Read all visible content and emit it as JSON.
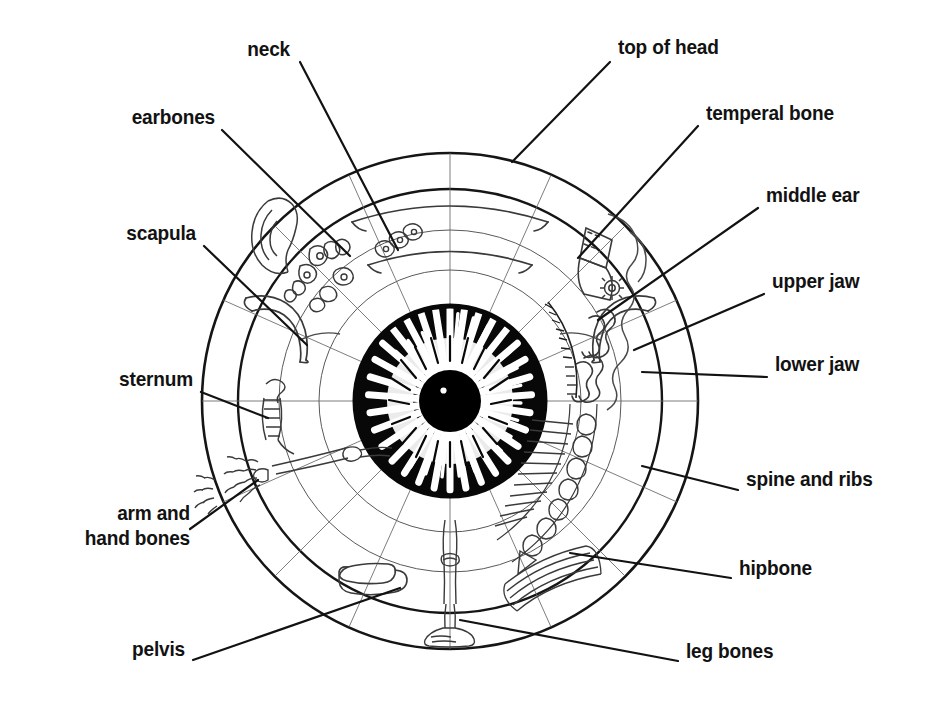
{
  "diagram": {
    "type": "labeled-anatomical-diagram",
    "colors": {
      "ink": "#121212",
      "background": "#ffffff",
      "fine_line": "#4a4a4a",
      "iris_fill": "#000000"
    },
    "geometry": {
      "center_x": 450,
      "center_y": 401,
      "outer_radius": 248,
      "ring_radii": [
        248,
        212,
        171,
        131,
        95,
        62
      ],
      "pupil_radius": 30
    },
    "labels": [
      {
        "id": "neck",
        "text": "neck",
        "side": "left",
        "x": 290,
        "y": 48,
        "anchor_x": 300,
        "anchor_y": 62,
        "target_x": 398,
        "target_y": 250
      },
      {
        "id": "earbones",
        "text": "earbones",
        "side": "left",
        "x": 215,
        "y": 116,
        "anchor_x": 222,
        "anchor_y": 130,
        "target_x": 350,
        "target_y": 256
      },
      {
        "id": "scapula",
        "text": "scapula",
        "side": "left",
        "x": 196,
        "y": 232,
        "anchor_x": 204,
        "anchor_y": 246,
        "target_x": 307,
        "target_y": 345
      },
      {
        "id": "sternum",
        "text": "sternum",
        "side": "left",
        "x": 193,
        "y": 378,
        "anchor_x": 201,
        "anchor_y": 392,
        "target_x": 268,
        "target_y": 418
      },
      {
        "id": "arm-hand-bones",
        "text": "arm and\nhand bones",
        "side": "left",
        "x": 182,
        "y": 512,
        "anchor_x": 190,
        "anchor_y": 529,
        "target_x": 258,
        "target_y": 480
      },
      {
        "id": "pelvis",
        "text": "pelvis",
        "side": "left",
        "x": 185,
        "y": 648,
        "anchor_x": 193,
        "anchor_y": 660,
        "target_x": 400,
        "target_y": 588
      },
      {
        "id": "top-of-head",
        "text": "top of head",
        "side": "right",
        "x": 618,
        "y": 46,
        "anchor_x": 610,
        "anchor_y": 62,
        "target_x": 512,
        "target_y": 162
      },
      {
        "id": "temperal-bone",
        "text": "temperal bone",
        "side": "right",
        "x": 706,
        "y": 112,
        "anchor_x": 698,
        "anchor_y": 126,
        "target_x": 578,
        "target_y": 258
      },
      {
        "id": "middle-ear",
        "text": "middle ear",
        "side": "right",
        "x": 766,
        "y": 194,
        "anchor_x": 758,
        "anchor_y": 208,
        "target_x": 598,
        "target_y": 320
      },
      {
        "id": "upper-jaw",
        "text": "upper jaw",
        "side": "right",
        "x": 772,
        "y": 280,
        "anchor_x": 764,
        "anchor_y": 294,
        "target_x": 634,
        "target_y": 350
      },
      {
        "id": "lower-jaw",
        "text": "lower jaw",
        "side": "right",
        "x": 775,
        "y": 363,
        "anchor_x": 767,
        "anchor_y": 377,
        "target_x": 642,
        "target_y": 372
      },
      {
        "id": "spine-and-ribs",
        "text": "spine and ribs",
        "side": "right",
        "x": 746,
        "y": 478,
        "anchor_x": 738,
        "anchor_y": 490,
        "target_x": 642,
        "target_y": 466
      },
      {
        "id": "hipbone",
        "text": "hipbone",
        "side": "right",
        "x": 739,
        "y": 567,
        "anchor_x": 731,
        "anchor_y": 578,
        "target_x": 570,
        "target_y": 553
      },
      {
        "id": "leg-bones",
        "text": "leg bones",
        "side": "right",
        "x": 686,
        "y": 650,
        "anchor_x": 678,
        "anchor_y": 661,
        "target_x": 460,
        "target_y": 620
      }
    ]
  }
}
